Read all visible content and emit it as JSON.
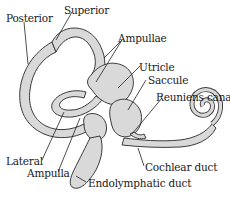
{
  "diagram": {
    "colors": {
      "fill": "#d9d9d9",
      "stroke": "#3a3a3a",
      "leader": "#222222",
      "background": "#ffffff"
    },
    "labels": {
      "posterior": "Posterior",
      "superior": "Superior",
      "ampullae": "Ampullae",
      "utricle": "Utricle",
      "saccule": "Saccule",
      "reuniens_canal": "Reuniens canal",
      "lateral": "Lateral",
      "ampulla": "Ampulla",
      "cochlear_duct": "Cochlear duct",
      "endolymphatic_duct": "Endolymphatic duct"
    }
  }
}
